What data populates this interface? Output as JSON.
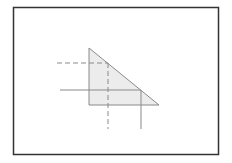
{
  "diagram": {
    "frame": {
      "x": 13.5,
      "y": 7.5,
      "width": 205,
      "height": 147,
      "stroke": "#333333",
      "stroke_width": 1.5
    },
    "triangle": {
      "points": "89,48 89,105 159,105",
      "fill": "#ececec",
      "stroke": "#8a8a8a"
    },
    "dashed_horizontal": {
      "x1": 57,
      "y1": 63,
      "x2": 108,
      "y2": 63,
      "stroke": "#8a8a8a"
    },
    "dashed_vertical": {
      "x1": 108,
      "y1": 63,
      "x2": 108,
      "y2": 129,
      "stroke": "#8a8a8a"
    },
    "solid_horizontal": {
      "x1": 60,
      "y1": 90,
      "x2": 141,
      "y2": 90,
      "stroke": "#8a8a8a"
    },
    "solid_vertical": {
      "x1": 141,
      "y1": 90,
      "x2": 141,
      "y2": 129,
      "stroke": "#8a8a8a"
    },
    "dash_pattern": "5,3"
  }
}
